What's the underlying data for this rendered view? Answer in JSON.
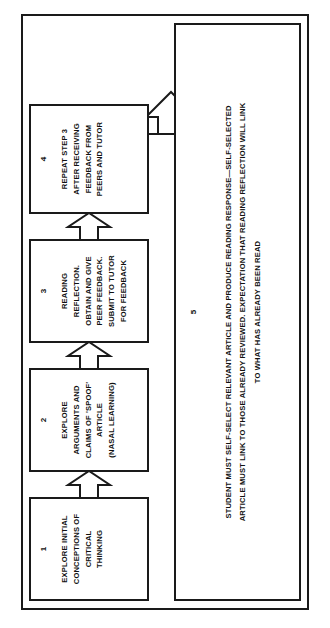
{
  "diagram": {
    "orientation": "rotated-90-ccw",
    "frame_color": "#1a1a1a",
    "background_color": "#ffffff",
    "nodes": [
      {
        "id": "1",
        "number": "1",
        "text": "EXPLORE INITIAL\nCONCEPTIONS OF\nCRITICAL\nTHINKING"
      },
      {
        "id": "2",
        "number": "2",
        "text": "EXPLORE\nARGUMENTS AND\nCLAIMS OF 'SPOOF'\nARTICLE\n(NASAL LEARNING)"
      },
      {
        "id": "3",
        "number": "3",
        "text": "READING\nREFLECTION.\nOBTAIN AND GIVE\nPEER FEEDBACK.\nSUBMIT TO TUTOR\nFOR FEEDBACK"
      },
      {
        "id": "4",
        "number": "4",
        "text": "REPEAT STEP 3\nAFTER RECEIVING\nFEEDBACK FROM\nPEERS AND TUTOR"
      },
      {
        "id": "5",
        "number": "5",
        "text": "STUDENT MUST SELF-SELECT RELEVANT ARTICLE AND PRODUCE READING RESPONSE—SELF-SELECTED\nARTICLE MUST LINK TO THOSE ALREADY REVIEWED. EXPECTATION THAT READING REFLECTION WILL LINK\nTO WHAT HAS ALREADY BEEN READ"
      }
    ],
    "connectors": [
      {
        "id": "1-2",
        "from": "1",
        "to": "2",
        "shape": "block-arrow",
        "direction": "forward"
      },
      {
        "id": "2-3",
        "from": "2",
        "to": "3",
        "shape": "block-arrow",
        "direction": "forward"
      },
      {
        "id": "3-4",
        "from": "3",
        "to": "4",
        "shape": "block-arrow",
        "direction": "forward"
      },
      {
        "id": "4-5",
        "from": "4",
        "to": "5",
        "shape": "block-arrow",
        "direction": "forward"
      }
    ]
  }
}
